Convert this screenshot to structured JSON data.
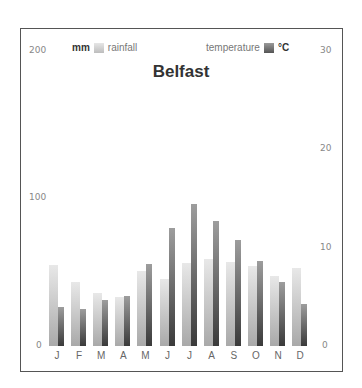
{
  "chart_data": {
    "type": "bar",
    "title": "Belfast",
    "categories": [
      "J",
      "F",
      "M",
      "A",
      "M",
      "J",
      "J",
      "A",
      "S",
      "O",
      "N",
      "D"
    ],
    "series": [
      {
        "name": "rainfall",
        "unit": "mm",
        "axis": "left",
        "values": [
          55,
          43,
          36,
          33,
          51,
          45,
          56,
          59,
          57,
          54,
          47,
          53
        ]
      },
      {
        "name": "temperature",
        "unit": "°C",
        "axis": "right",
        "values": [
          4.0,
          3.8,
          4.7,
          5.1,
          8.3,
          12.0,
          14.4,
          12.7,
          10.7,
          8.6,
          6.5,
          4.3
        ]
      }
    ],
    "left_axis": {
      "label": "mm",
      "ticks": [
        0,
        100,
        200
      ],
      "range": [
        0,
        200
      ]
    },
    "right_axis": {
      "label": "°C",
      "ticks": [
        0,
        10,
        20,
        30
      ],
      "range": [
        0,
        30
      ]
    },
    "legend": [
      {
        "unit": "mm",
        "label": "rainfall"
      },
      {
        "label": "temperature",
        "unit": "°C"
      }
    ],
    "grid": false
  },
  "labels": {
    "title": "Belfast",
    "left_unit": "mm",
    "rain_label": "rainfall",
    "temp_label": "temperature",
    "right_unit": "°C",
    "left_ticks": [
      "200",
      "100",
      "0"
    ],
    "right_ticks": [
      "30",
      "20",
      "10",
      "0"
    ]
  }
}
